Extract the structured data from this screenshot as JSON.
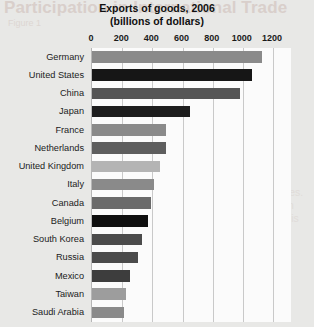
{
  "watermark": {
    "heading": "Participation in International Trade",
    "subheading": "Figure 1",
    "body": "merchandise exports than the United States. In fact, Germany exports about as much in goods as China. Yet Germany's economy is much smaller than the U.S. or Chinese economies."
  },
  "chart_data": {
    "type": "bar",
    "orientation": "horizontal",
    "title": "Exports of goods, 2006",
    "subtitle": "(billions of dollars)",
    "xlabel": "",
    "ylabel": "",
    "xlim": [
      0,
      1200
    ],
    "xticks": [
      0,
      200,
      400,
      600,
      800,
      1000,
      1200
    ],
    "xtick_labels": [
      "0",
      "200",
      "400",
      "600",
      "800",
      "1000",
      "1200"
    ],
    "grid": true,
    "legend": false,
    "categories": [
      "Germany",
      "United States",
      "China",
      "Japan",
      "France",
      "Netherlands",
      "United Kingdom",
      "Italy",
      "Canada",
      "Belgium",
      "South Korea",
      "Russia",
      "Mexico",
      "Taiwan",
      "Saudi Arabia"
    ],
    "values": [
      1130,
      1060,
      980,
      650,
      490,
      490,
      450,
      410,
      390,
      370,
      330,
      305,
      250,
      225,
      210
    ],
    "bar_colors": [
      "#8a8a8a",
      "#161616",
      "#555555",
      "#1d1d1d",
      "#8a8a8a",
      "#5e5e5e",
      "#b4b4b4",
      "#8a8a8a",
      "#6a6a6a",
      "#0f0f0f",
      "#4b4b4b",
      "#4b4b4b",
      "#3d3d3d",
      "#9d9d9d",
      "#8a8a8a"
    ]
  },
  "colors": {
    "page_background": "#e8e8e6",
    "plot_background": "#fbfbfb",
    "gridline": "#c9c9c9",
    "text": "#101010"
  }
}
